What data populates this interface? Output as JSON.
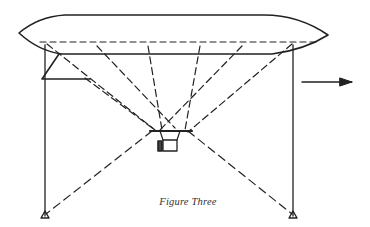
{
  "figure": {
    "caption": "Figure Three",
    "stroke_color": "#222222",
    "background": "#ffffff",
    "elements": {
      "balloon_envelope": "elongated airship envelope with pointed ends",
      "left_mast": "vertical solid post on left with triangular base",
      "right_mast": "vertical solid post on right with triangular base",
      "left_brace": "small triangular bracket near top of left mast",
      "gondola": "small basket/car suspended at center with propeller",
      "mooring_lines": "dashed lines from envelope and mast bases converging to gondola",
      "direction_arrow": "arrow pointing right"
    }
  }
}
